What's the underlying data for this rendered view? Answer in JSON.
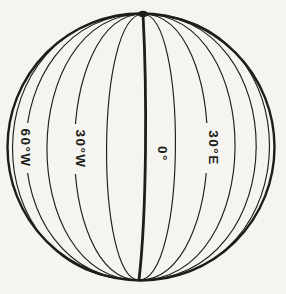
{
  "diagram": {
    "name": "globe-meridians-of-longitude",
    "colors": {
      "paper": "#f5f4f0",
      "ink": "#1d1d1b"
    },
    "globe": {
      "cx": 141,
      "cy": 147,
      "r": 133.5,
      "pole_top": {
        "x": 143,
        "y": 14
      },
      "pole_bottom": {
        "x": 139,
        "y": 280
      }
    },
    "meridians": {
      "spacing_deg": 15,
      "longitudes_deg": [
        -75,
        -60,
        -45,
        -30,
        -15,
        0,
        15,
        30,
        45,
        60,
        75
      ],
      "prime_meridian_thick": true
    },
    "labels": [
      {
        "text": "60°W",
        "x": 25,
        "y": 148,
        "rotation_deg": 90,
        "box_w": 16,
        "box_h": 50
      },
      {
        "text": "30°W",
        "x": 80,
        "y": 149,
        "rotation_deg": 90,
        "box_w": 16,
        "box_h": 50
      },
      {
        "text": "0°",
        "x": 162,
        "y": 154,
        "rotation_deg": 90,
        "box_w": 16,
        "box_h": 27
      },
      {
        "text": "30°E",
        "x": 213,
        "y": 148,
        "rotation_deg": 90,
        "box_w": 16,
        "box_h": 50
      }
    ]
  }
}
